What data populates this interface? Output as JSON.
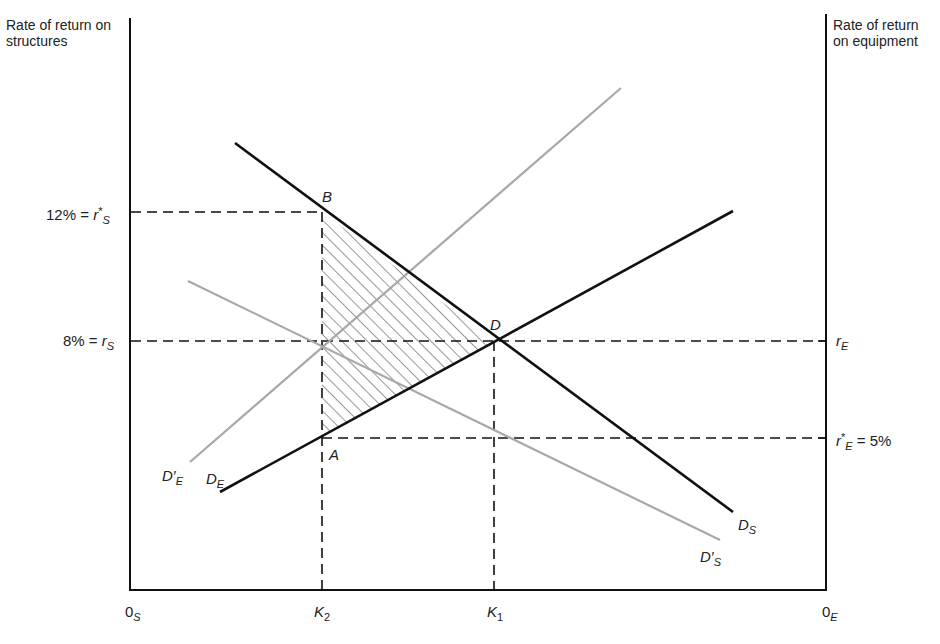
{
  "diagram": {
    "left_axis_title": "Rate of return on structures",
    "right_axis_title": "Rate of return on equipment",
    "left_ticks": [
      {
        "value": "12%",
        "symbol": "r",
        "sup": "*",
        "sub": "S",
        "prefix": "12% = "
      },
      {
        "value": "8%",
        "symbol": "r",
        "sup": "",
        "sub": "S",
        "prefix": "8% = "
      }
    ],
    "right_ticks": [
      {
        "symbol": "r",
        "sup": "",
        "sub": "E",
        "suffix": ""
      },
      {
        "symbol": "r",
        "sup": "*",
        "sub": "E",
        "suffix": " = 5%"
      }
    ],
    "x_axis": {
      "origin_left": {
        "base": "0",
        "sub": "S"
      },
      "origin_right": {
        "base": "0",
        "sub": "E"
      },
      "ticks": [
        {
          "base": "K",
          "sub": "2"
        },
        {
          "base": "K",
          "sub": "1"
        }
      ]
    },
    "points": {
      "B": "B",
      "D": "D",
      "A": "A"
    },
    "curves": [
      {
        "id": "D_S",
        "base": "D",
        "prime": "",
        "sub": "S",
        "color": "#111111",
        "from": [
          235,
          143
        ],
        "to": [
          733,
          512
        ]
      },
      {
        "id": "D_E",
        "base": "D",
        "prime": "",
        "sub": "E",
        "color": "#111111",
        "from": [
          220,
          492
        ],
        "to": [
          733,
          211
        ]
      },
      {
        "id": "D'_E",
        "base": "D",
        "prime": "′",
        "sub": "E",
        "color": "#a8a8a8",
        "from": [
          190,
          462
        ],
        "to": [
          621,
          88
        ]
      },
      {
        "id": "D'_S",
        "base": "D",
        "prime": "′",
        "sub": "S",
        "color": "#a8a8a8",
        "from": [
          188,
          281
        ],
        "to": [
          720,
          540
        ]
      }
    ],
    "shaded_region": "triangle ABD (deadweight loss)"
  }
}
